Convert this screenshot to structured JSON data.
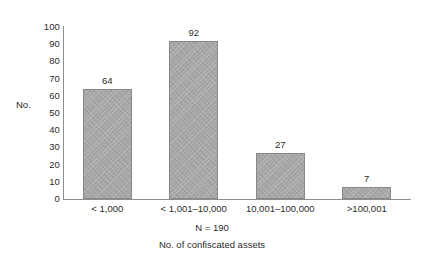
{
  "chart_data": {
    "type": "bar",
    "title": "",
    "subtitle": "",
    "categories": [
      "< 1,000",
      "< 1,001–10,000",
      "10,001–100,000",
      ">100,001"
    ],
    "values": [
      64,
      92,
      27,
      7
    ],
    "data_labels": [
      "64",
      "92",
      "27",
      "7"
    ],
    "xlabel": "No. of confiscated assets",
    "ylabel": "No.",
    "ylim": [
      0,
      100
    ],
    "y_ticks": [
      0,
      10,
      20,
      30,
      40,
      50,
      60,
      70,
      80,
      90,
      100
    ],
    "y_tick_labels": [
      "0",
      "10",
      "20",
      "30",
      "40",
      "50",
      "60",
      "70",
      "80",
      "90",
      "100"
    ],
    "annotation": "N = 190",
    "grid": false,
    "legend": false,
    "legend_position": "none",
    "bar_fill_color": "#a9a9a9",
    "bar_border_color": "#888888",
    "axis_color": "#8e8e8e",
    "text_color": "#2b2b2b",
    "background_color": "#ffffff"
  }
}
